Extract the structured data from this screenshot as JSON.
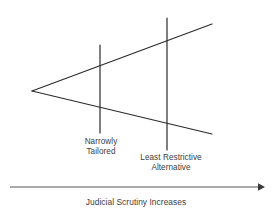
{
  "diagram": {
    "axis": {
      "caption": "Judicial Scrutiny Increases",
      "direction": "right",
      "arrow_icon": "arrow-right-icon",
      "start_x": 10,
      "end_x": 263,
      "y": 187,
      "color": "#555555"
    },
    "wedge": {
      "vertex": {
        "x": 32,
        "y": 91
      },
      "upper_end": {
        "x": 212,
        "y": 24
      },
      "lower_end": {
        "x": 212,
        "y": 134
      },
      "color": "#2b2b2b"
    },
    "markers": [
      {
        "id": "narrowly-tailored",
        "x": 100,
        "top_y": 45,
        "bottom_y": 133,
        "line1": "Narrowly",
        "line2": "Tailored",
        "color": "#2b2b2b"
      },
      {
        "id": "least-restrictive-alternative",
        "x": 167,
        "top_y": 18,
        "bottom_y": 150,
        "line1": "Least Restrictive",
        "line2": "Alternative",
        "color": "#2b2b2b"
      }
    ]
  }
}
